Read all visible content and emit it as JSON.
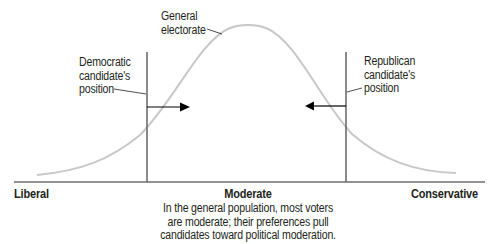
{
  "diagram": {
    "title": "",
    "curve": {
      "name": "General electorate",
      "color": "#c8c8c8"
    },
    "axis": {
      "color": "#6d6d6d",
      "left_label": "Liberal",
      "center_label": "Moderate",
      "right_label": "Conservative"
    },
    "labels": {
      "electorate_line1": "General",
      "electorate_line2": "electorate",
      "dem_line1": "Democratic",
      "dem_line2": "candidate's",
      "dem_line3": "position",
      "rep_line1": "Republican",
      "rep_line2": "candidate's",
      "rep_line3": "position"
    },
    "caption": {
      "line1": "In the general population, most voters",
      "line2": "are moderate; their preferences pull",
      "line3": "candidates toward political moderation."
    },
    "arrows": [
      {
        "from": "Democratic candidate's position",
        "direction": "right",
        "color": "#000000"
      },
      {
        "from": "Republican candidate's position",
        "direction": "left",
        "color": "#000000"
      }
    ]
  }
}
